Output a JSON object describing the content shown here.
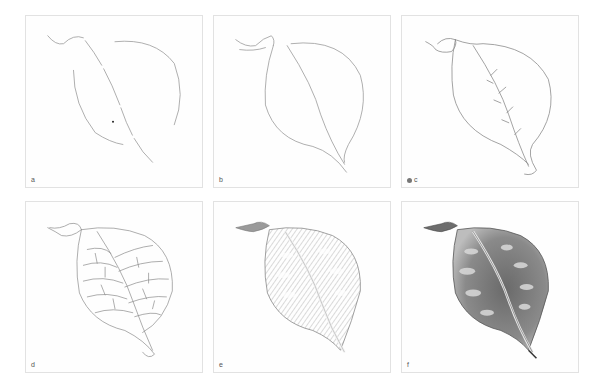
{
  "figure": {
    "panels": [
      {
        "id": "a",
        "label": "a",
        "stage": "initial gesture outline"
      },
      {
        "id": "b",
        "label": "b",
        "stage": "refined outline"
      },
      {
        "id": "c",
        "label": "c",
        "stage": "contour with midrib and vein starts"
      },
      {
        "id": "d",
        "label": "d",
        "stage": "vein network"
      },
      {
        "id": "e",
        "label": "e",
        "stage": "light tonal shading"
      },
      {
        "id": "f",
        "label": "f",
        "stage": "full tonal rendering"
      }
    ]
  },
  "colors": {
    "background": "#ffffff",
    "border": "#e2e2e2",
    "line": "#8a8a8a",
    "dark": "#3a3a3a"
  }
}
